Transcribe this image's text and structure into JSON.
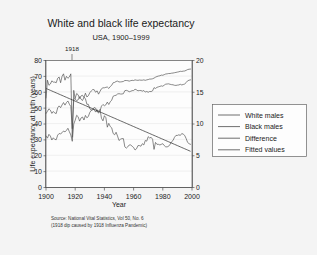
{
  "chart_data": {
    "type": "line",
    "title": "White and black life expectancy",
    "subtitle": "USA, 1900–1999",
    "xlabel": "Year",
    "ylabel": "Life expectancy at birth (years)",
    "xlim": [
      1900,
      2000
    ],
    "ylim": [
      0,
      80
    ],
    "y2lim": [
      0,
      20
    ],
    "xticks": [
      "1900",
      "1920",
      "1940",
      "1960",
      "1980",
      "2000"
    ],
    "yticks": [
      "0",
      "10",
      "20",
      "30",
      "40",
      "50",
      "60",
      "70",
      "80"
    ],
    "y2ticks": [
      "0",
      "5",
      "10",
      "15",
      "20"
    ],
    "grid": true,
    "legend_position": "right",
    "annotations": [
      {
        "label": "1918",
        "x": 1918,
        "note": "tick above plot marking 1918 influenza pandemic dip"
      }
    ],
    "notes": [
      "Source: National Vital Statistics, Vol 50, No. 6",
      "(1918 dip caused by 1918 Influenza Pandemic)"
    ],
    "x": [
      1900,
      1901,
      1902,
      1903,
      1904,
      1905,
      1906,
      1907,
      1908,
      1909,
      1910,
      1911,
      1912,
      1913,
      1914,
      1915,
      1916,
      1917,
      1918,
      1919,
      1920,
      1921,
      1922,
      1923,
      1924,
      1925,
      1926,
      1927,
      1928,
      1929,
      1930,
      1931,
      1932,
      1933,
      1934,
      1935,
      1936,
      1937,
      1938,
      1939,
      1940,
      1941,
      1942,
      1943,
      1944,
      1945,
      1946,
      1947,
      1948,
      1949,
      1950,
      1951,
      1952,
      1953,
      1954,
      1955,
      1956,
      1957,
      1958,
      1959,
      1960,
      1961,
      1962,
      1963,
      1964,
      1965,
      1966,
      1967,
      1968,
      1969,
      1970,
      1971,
      1972,
      1973,
      1974,
      1975,
      1976,
      1977,
      1978,
      1979,
      1980,
      1981,
      1982,
      1983,
      1984,
      1985,
      1986,
      1987,
      1988,
      1989,
      1990,
      1991,
      1992,
      1993,
      1994,
      1995,
      1996,
      1997,
      1998,
      1999
    ],
    "series": [
      {
        "name": "White males",
        "axis": "left",
        "values": [
          46.6,
          48.0,
          49.6,
          48.7,
          46.7,
          47.9,
          46.9,
          46.6,
          50.2,
          51.4,
          50.3,
          52.0,
          53.5,
          51.9,
          53.5,
          54.5,
          52.5,
          51.0,
          37.0,
          55.3,
          56.3,
          59.2,
          58.4,
          56.1,
          57.7,
          58.1,
          56.7,
          59.4,
          57.0,
          57.8,
          59.7,
          60.8,
          61.7,
          61.6,
          60.0,
          60.9,
          58.8,
          60.6,
          62.2,
          62.8,
          62.8,
          63.1,
          63.3,
          62.4,
          63.6,
          64.4,
          66.0,
          66.2,
          66.8,
          67.0,
          66.5,
          66.5,
          66.6,
          66.8,
          67.4,
          67.4,
          67.3,
          67.0,
          67.3,
          67.5,
          67.4,
          67.8,
          67.6,
          67.5,
          67.7,
          67.6,
          67.6,
          67.8,
          67.5,
          67.8,
          68.0,
          68.3,
          68.3,
          68.5,
          68.9,
          69.5,
          69.9,
          70.2,
          70.4,
          70.8,
          70.7,
          71.1,
          71.5,
          71.6,
          71.8,
          71.8,
          72.0,
          72.1,
          72.3,
          72.5,
          72.7,
          72.9,
          73.2,
          73.1,
          73.3,
          73.4,
          73.8,
          74.3,
          74.5,
          74.6
        ],
        "data_labels": []
      },
      {
        "name": "Black males",
        "axis": "left",
        "values": [
          32.5,
          31.1,
          33.5,
          32.4,
          29.9,
          31.3,
          30.3,
          30.1,
          33.0,
          34.0,
          33.8,
          34.5,
          35.6,
          35.0,
          36.0,
          37.3,
          35.1,
          33.1,
          29.1,
          40.0,
          42.4,
          45.5,
          44.6,
          41.8,
          43.8,
          44.4,
          42.5,
          45.4,
          43.9,
          44.7,
          47.3,
          48.6,
          49.5,
          49.0,
          47.5,
          49.0,
          46.8,
          48.3,
          51.3,
          52.3,
          51.5,
          52.1,
          53.8,
          52.3,
          54.0,
          55.0,
          57.5,
          57.9,
          58.1,
          58.9,
          59.1,
          58.9,
          58.9,
          59.1,
          61.0,
          61.2,
          60.9,
          60.3,
          60.6,
          61.0,
          61.1,
          61.9,
          61.5,
          60.9,
          61.1,
          61.1,
          60.7,
          61.1,
          60.1,
          60.5,
          60.0,
          60.5,
          60.4,
          60.9,
          62.9,
          62.4,
          63.1,
          63.4,
          63.7,
          64.0,
          63.8,
          64.5,
          65.1,
          65.2,
          65.3,
          65.0,
          64.8,
          64.7,
          64.4,
          64.3,
          64.5,
          64.6,
          65.0,
          64.6,
          64.9,
          65.2,
          66.1,
          67.2,
          67.6,
          67.8
        ],
        "data_labels": []
      },
      {
        "name": "Difference",
        "axis": "right",
        "values": [
          14.1,
          16.9,
          16.1,
          16.3,
          16.8,
          16.6,
          16.6,
          16.5,
          17.2,
          17.4,
          16.5,
          17.5,
          17.9,
          16.9,
          17.5,
          17.2,
          17.4,
          17.9,
          7.9,
          15.3,
          13.9,
          13.7,
          13.8,
          14.3,
          13.9,
          13.7,
          14.2,
          14.0,
          13.1,
          13.1,
          12.4,
          12.2,
          12.2,
          12.6,
          12.5,
          11.9,
          12.0,
          12.3,
          10.9,
          10.5,
          11.3,
          11.0,
          9.5,
          10.1,
          9.6,
          9.4,
          8.5,
          8.3,
          8.7,
          8.1,
          7.4,
          7.6,
          7.7,
          7.7,
          6.4,
          6.2,
          6.4,
          6.7,
          6.7,
          6.5,
          6.3,
          5.9,
          6.1,
          6.6,
          6.6,
          6.5,
          6.9,
          6.7,
          7.4,
          7.3,
          8.0,
          7.8,
          7.9,
          7.6,
          6.0,
          7.1,
          6.8,
          6.8,
          6.7,
          6.8,
          6.9,
          6.6,
          6.4,
          6.4,
          6.5,
          6.8,
          7.2,
          7.4,
          7.9,
          8.2,
          8.2,
          8.3,
          8.2,
          8.5,
          8.4,
          8.2,
          7.7,
          7.1,
          6.9,
          6.8
        ],
        "data_labels": []
      },
      {
        "name": "Fitted values",
        "axis": "right",
        "values": [
          15.6,
          15.5,
          15.4,
          15.3,
          15.2,
          15.1,
          15.0,
          14.9,
          14.8,
          14.7,
          14.6,
          14.5,
          14.4,
          14.3,
          14.2,
          14.1,
          14.0,
          13.9,
          13.8,
          13.7,
          13.6,
          13.5,
          13.4,
          13.3,
          13.2,
          13.1,
          13.0,
          12.9,
          12.8,
          12.7,
          12.6,
          12.5,
          12.4,
          12.3,
          12.2,
          12.1,
          12.0,
          11.9,
          11.8,
          11.7,
          11.6,
          11.5,
          11.4,
          11.3,
          11.2,
          11.1,
          11.0,
          10.9,
          10.8,
          10.7,
          10.6,
          10.5,
          10.4,
          10.3,
          10.2,
          10.1,
          10.0,
          9.9,
          9.8,
          9.7,
          9.6,
          9.5,
          9.4,
          9.3,
          9.2,
          9.1,
          9.0,
          8.9,
          8.8,
          8.7,
          8.6,
          8.5,
          8.4,
          8.3,
          8.2,
          8.1,
          8.0,
          7.9,
          7.8,
          7.7,
          7.6,
          7.5,
          7.4,
          7.3,
          7.2,
          7.1,
          7.0,
          6.9,
          6.8,
          6.7,
          6.6,
          6.5,
          6.4,
          6.3,
          6.2,
          6.1,
          6.0,
          5.9,
          5.8,
          5.7
        ],
        "data_labels": []
      }
    ]
  },
  "legend": {
    "entries": [
      "White males",
      "Black males",
      "Difference",
      "Fitted values"
    ]
  }
}
